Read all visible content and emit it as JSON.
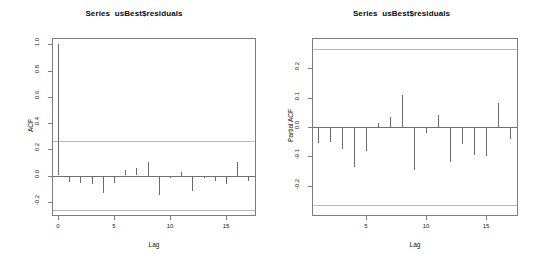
{
  "figure": {
    "background": "#ffffff",
    "width": 535,
    "height": 272,
    "line_color": "#6b6b6b",
    "ci_color": "#b9b9b9",
    "frame_color": "#7d7d7d"
  },
  "chart_data": [
    {
      "type": "bar",
      "name": "acf",
      "title": "Series  usBest$residuals",
      "xlabel": "Lag",
      "ylabel": "ACF",
      "xlim": [
        -0.45,
        17.6
      ],
      "ylim": [
        -0.3,
        1.04
      ],
      "grid": false,
      "legend": "none",
      "xticks": [
        0,
        5,
        10,
        15
      ],
      "xticklabels": [
        "0",
        "5",
        "10",
        "15"
      ],
      "yticks": [
        1.0,
        0.8,
        0.6,
        0.4,
        0.2,
        0.0,
        -0.2
      ],
      "yticklabels": [
        "1.0",
        "0.8",
        "0.6",
        "0.4",
        "0.2",
        "0.0",
        "-0.2"
      ],
      "confidence_bands": [
        0.265,
        -0.265
      ],
      "x": [
        0,
        1,
        2,
        3,
        4,
        5,
        6,
        7,
        8,
        9,
        10,
        11,
        12,
        13,
        14,
        15,
        16,
        17
      ],
      "values": [
        1.0,
        -0.045,
        -0.05,
        -0.063,
        -0.128,
        -0.053,
        0.04,
        0.055,
        0.105,
        -0.148,
        -0.018,
        0.03,
        -0.118,
        -0.012,
        -0.038,
        -0.058,
        0.103,
        -0.04
      ]
    },
    {
      "type": "bar",
      "name": "pacf",
      "title": "Series  usBest$residuals",
      "xlabel": "Lag",
      "ylabel": "Partial ACF",
      "xlim": [
        0.55,
        17.6
      ],
      "ylim": [
        -0.3,
        0.3
      ],
      "grid": false,
      "legend": "none",
      "xticks": [
        5,
        10,
        15
      ],
      "xticklabels": [
        "5",
        "10",
        "15"
      ],
      "yticks": [
        0.2,
        0.1,
        0.0,
        -0.1,
        -0.2
      ],
      "yticklabels": [
        "0.2",
        "0.1",
        "0.0",
        "-0.1",
        "-0.2"
      ],
      "confidence_bands": [
        0.265,
        -0.265
      ],
      "x": [
        1,
        2,
        3,
        4,
        5,
        6,
        7,
        8,
        9,
        10,
        11,
        12,
        13,
        14,
        15,
        16,
        17
      ],
      "values": [
        -0.055,
        -0.052,
        -0.075,
        -0.135,
        -0.082,
        0.013,
        0.035,
        0.11,
        -0.145,
        -0.022,
        0.042,
        -0.118,
        -0.057,
        -0.095,
        -0.098,
        0.082,
        -0.042
      ]
    }
  ]
}
